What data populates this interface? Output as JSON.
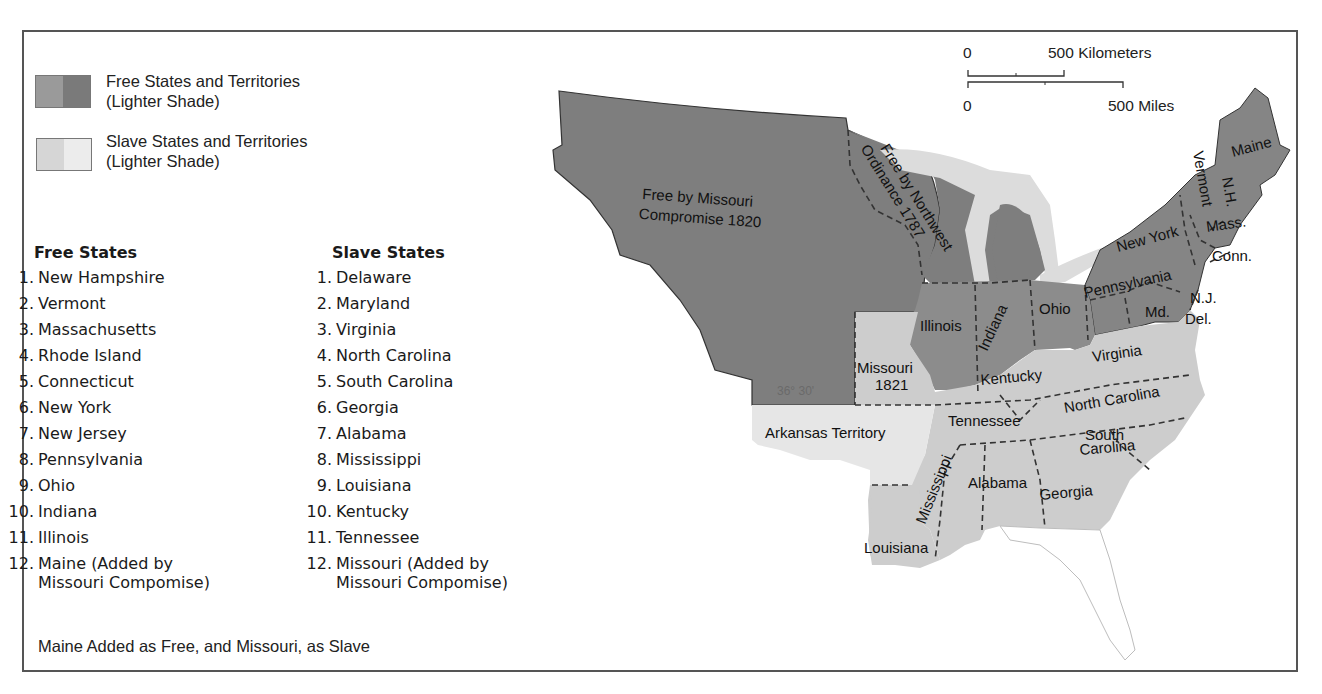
{
  "legend": {
    "free": {
      "label_line1": "Free States and Territories",
      "label_line2": "(Lighter Shade)",
      "swatch_colors": [
        "#9a9a9a",
        "#7a7a7a"
      ]
    },
    "slave": {
      "label_line1": "Slave States and Territories",
      "label_line2": "(Lighter Shade)",
      "swatch_colors": [
        "#d6d6d6",
        "#ececec"
      ]
    }
  },
  "free_states": {
    "heading": "Free States",
    "items": [
      {
        "num": "1.",
        "name": "New Hampshire"
      },
      {
        "num": "2.",
        "name": "Vermont"
      },
      {
        "num": "3.",
        "name": "Massachusetts"
      },
      {
        "num": "4.",
        "name": "Rhode Island"
      },
      {
        "num": "5.",
        "name": "Connecticut"
      },
      {
        "num": "6.",
        "name": "New York"
      },
      {
        "num": "7.",
        "name": "New Jersey"
      },
      {
        "num": "8.",
        "name": "Pennsylvania"
      },
      {
        "num": "9.",
        "name": "Ohio"
      },
      {
        "num": "10.",
        "name": "Indiana"
      },
      {
        "num": "11.",
        "name": "Illinois"
      },
      {
        "num": "12.",
        "name": "Maine (Added by",
        "cont": "Missouri Compomise)"
      }
    ]
  },
  "slave_states": {
    "heading": "Slave States",
    "items": [
      {
        "num": "1.",
        "name": "Delaware"
      },
      {
        "num": "2.",
        "name": "Maryland"
      },
      {
        "num": "3.",
        "name": "Virginia"
      },
      {
        "num": "4.",
        "name": "North Carolina"
      },
      {
        "num": "5.",
        "name": "South Carolina"
      },
      {
        "num": "6.",
        "name": "Georgia"
      },
      {
        "num": "7.",
        "name": "Alabama"
      },
      {
        "num": "8.",
        "name": "Mississippi"
      },
      {
        "num": "9.",
        "name": "Louisiana"
      },
      {
        "num": "10.",
        "name": "Kentucky"
      },
      {
        "num": "11.",
        "name": "Tennessee"
      },
      {
        "num": "12.",
        "name": "Missouri (Added by",
        "cont": "Missouri Compomise)"
      }
    ]
  },
  "caption": "Maine Added as Free, and Missouri, as Slave",
  "scale_bar": {
    "km_zero": "0",
    "km_label": "500 Kilometers",
    "mi_zero": "0",
    "mi_label": "500 Miles"
  },
  "map": {
    "colors": {
      "free_territory": "#7e7e7e",
      "free_state": "#8c8c8c",
      "slave_state": "#cdcdcd",
      "slave_territory": "#e6e6e6",
      "lakes": "#dcdcdc",
      "florida_outline": "#bdbdbd"
    },
    "labels": {
      "missouri_compromise_l1": "Free by Missouri",
      "missouri_compromise_l2": "Compromise 1820",
      "northwest_l1": "Free by Northwest",
      "northwest_l2": "Ordinance 1787",
      "latitude": "36° 30'",
      "maine": "Maine",
      "vermont": "Vermont",
      "nh": "N.H.",
      "mass": "Mass.",
      "conn": "Conn.",
      "new_york": "New York",
      "pennsylvania": "Pennsylvania",
      "nj": "N.J.",
      "md": "Md.",
      "del": "Del.",
      "ohio": "Ohio",
      "indiana": "Indiana",
      "illinois": "Illinois",
      "missouri_l1": "Missouri",
      "missouri_l2": "1821",
      "kentucky": "Kentucky",
      "virginia": "Virginia",
      "tennessee": "Tennessee",
      "north_carolina": "North Carolina",
      "south_l1": "South",
      "south_l2": "Carolina",
      "arkansas": "Arkansas Territory",
      "mississippi": "Mississippi",
      "alabama": "Alabama",
      "georgia": "Georgia",
      "louisiana": "Louisiana"
    }
  }
}
